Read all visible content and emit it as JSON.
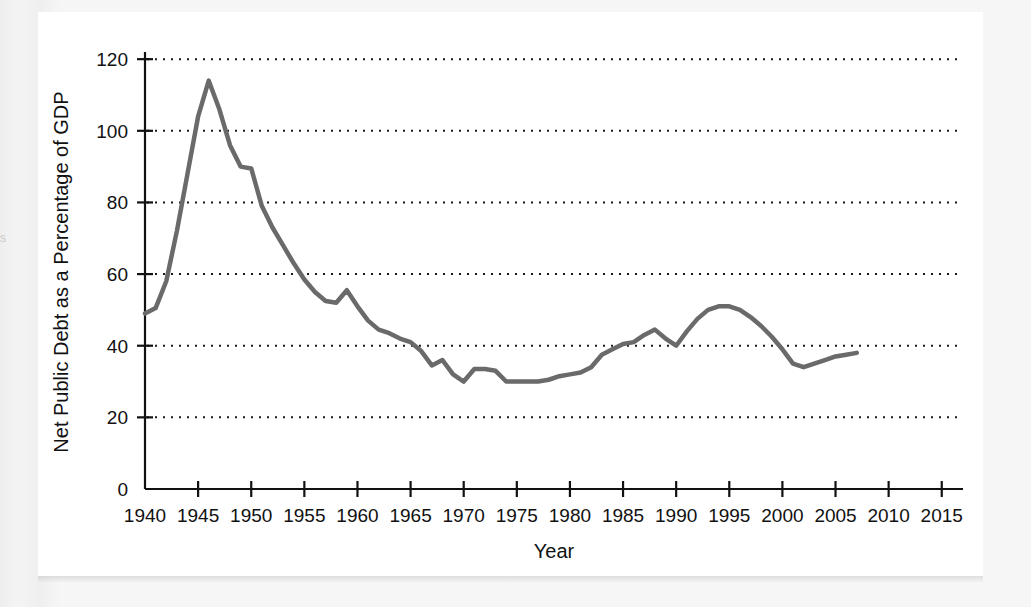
{
  "figure": {
    "panel_background": "#ffffff",
    "page_background": "#f1f1f1",
    "edge_glyph": "s"
  },
  "chart_data": {
    "type": "line",
    "title": "",
    "xlabel": "Year",
    "ylabel": "Net Public Debt as a Percentage of GDP",
    "xlim": [
      1940,
      2017
    ],
    "ylim": [
      0,
      122
    ],
    "xticks": [
      1940,
      1945,
      1950,
      1955,
      1960,
      1965,
      1970,
      1975,
      1980,
      1985,
      1990,
      1995,
      2000,
      2005,
      2010,
      2015
    ],
    "xtick_labels": [
      "1940",
      "1945",
      "1950",
      "1955",
      "1960",
      "1965",
      "1970",
      "1975",
      "1980",
      "1985",
      "1990",
      "1995",
      "2000",
      "2005",
      "2010",
      "2015"
    ],
    "yticks": [
      0,
      20,
      40,
      60,
      80,
      100,
      120
    ],
    "ytick_labels": [
      "0",
      "20",
      "40",
      "60",
      "80",
      "100",
      "120"
    ],
    "grid": true,
    "grid_style": "dotted",
    "grid_color": "#1a1a1a",
    "legend": false,
    "line_color": "#6a6a6a",
    "line_width": 4.5,
    "series": [
      {
        "name": "Net Public Debt as a Percentage of GDP",
        "x": [
          1940,
          1941,
          1942,
          1943,
          1944,
          1945,
          1946,
          1947,
          1948,
          1949,
          1950,
          1951,
          1952,
          1953,
          1954,
          1955,
          1956,
          1957,
          1958,
          1959,
          1960,
          1961,
          1962,
          1963,
          1964,
          1965,
          1966,
          1967,
          1968,
          1969,
          1970,
          1971,
          1972,
          1973,
          1974,
          1975,
          1976,
          1977,
          1978,
          1979,
          1980,
          1981,
          1982,
          1983,
          1984,
          1985,
          1986,
          1987,
          1988,
          1989,
          1990,
          1991,
          1992,
          1993,
          1994,
          1995,
          1996,
          1997,
          1998,
          1999,
          2000,
          2001,
          2002,
          2003,
          2004,
          2005,
          2006,
          2007
        ],
        "y": [
          49.0,
          50.5,
          58.0,
          72.0,
          88.0,
          104.0,
          114.0,
          106.0,
          96.0,
          90.0,
          89.5,
          79.0,
          73.0,
          68.0,
          63.0,
          58.5,
          55.0,
          52.5,
          52.0,
          55.5,
          51.0,
          47.0,
          44.5,
          43.5,
          42.0,
          41.0,
          38.5,
          34.5,
          36.0,
          32.0,
          30.0,
          33.5,
          33.5,
          33.0,
          30.0,
          30.0,
          30.0,
          30.0,
          30.5,
          31.5,
          32.0,
          32.5,
          34.0,
          37.5,
          39.0,
          40.5,
          41.0,
          43.0,
          44.5,
          42.0,
          40.0,
          44.0,
          47.5,
          50.0,
          51.0,
          51.0,
          50.0,
          48.0,
          45.5,
          42.5,
          39.0,
          35.0,
          34.0,
          35.0,
          36.0,
          37.0,
          37.5,
          38.0
        ]
      }
    ],
    "annotations": {
      "peak_year": 1946,
      "peak_value": 114,
      "trough_year": 1970,
      "trough_value": 30
    }
  }
}
